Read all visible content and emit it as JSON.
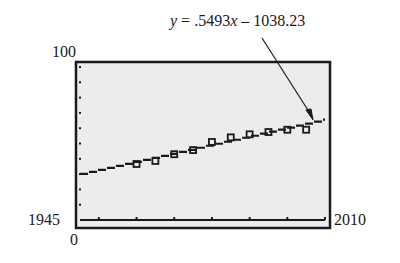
{
  "chart_data": {
    "type": "scatter",
    "title": "",
    "annotation": {
      "equation_prefix": "y",
      "equation_rest": " = .5493",
      "equation_var": "x",
      "equation_tail": " – 1038.23",
      "slope": 0.5493,
      "intercept": -1038.23
    },
    "xlabel": "",
    "ylabel": "",
    "xlim": [
      1945,
      2010
    ],
    "ylim": [
      0,
      100
    ],
    "x_tick_step": 10,
    "y_tick_step": 10,
    "x_min_label": "1945",
    "x_max_label": "2010",
    "y_min_label": "0",
    "y_max_label": "100",
    "grid": false,
    "series": [
      {
        "name": "data",
        "marker": "square",
        "x": [
          1960,
          1965,
          1970,
          1975,
          1980,
          1985,
          1990,
          1995,
          2000,
          2005
        ],
        "y": [
          36.6,
          38.6,
          43.0,
          45.7,
          51.0,
          54.0,
          56.0,
          57.5,
          59.0,
          59.0
        ]
      },
      {
        "name": "regression line",
        "type": "line",
        "x": [
          1945,
          2010
        ],
        "y": [
          30.23,
          65.93
        ]
      }
    ],
    "colors": {
      "plot_bg": "#ececec",
      "ink": "#1a1a1a"
    }
  }
}
